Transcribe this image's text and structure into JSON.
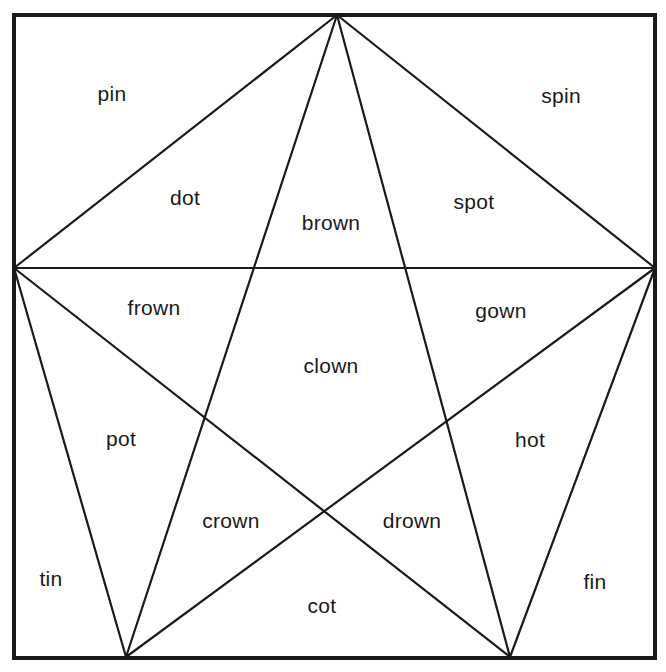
{
  "diagram": {
    "type": "pentagram-word-puzzle",
    "frame": {
      "x": 14,
      "y": 15,
      "width": 641,
      "height": 643
    },
    "vertices": {
      "top": [
        337,
        15
      ],
      "left": [
        14,
        268
      ],
      "right": [
        655,
        268
      ],
      "bottom_left": [
        126,
        657
      ],
      "bottom_right": [
        510,
        657
      ]
    },
    "lines": [
      {
        "name": "pentagon-top-left",
        "from": "top",
        "to": "left"
      },
      {
        "name": "pentagon-top-right",
        "from": "top",
        "to": "right"
      },
      {
        "name": "pentagon-left-bottom-left",
        "from": "left",
        "to": "bottom_left"
      },
      {
        "name": "pentagon-right-bottom-right",
        "from": "right",
        "to": "bottom_right"
      },
      {
        "name": "star-left-right",
        "from": "left",
        "to": "right"
      },
      {
        "name": "star-top-bottom-left",
        "from": "top",
        "to": "bottom_left"
      },
      {
        "name": "star-top-bottom-right",
        "from": "top",
        "to": "bottom_right"
      },
      {
        "name": "star-left-bottom-right",
        "from": "left",
        "to": "bottom_right"
      },
      {
        "name": "star-right-bottom-left",
        "from": "right",
        "to": "bottom_left"
      }
    ],
    "labels": {
      "pin": "pin",
      "spin": "spin",
      "dot": "dot",
      "brown": "brown",
      "spot": "spot",
      "frown": "frown",
      "gown": "gown",
      "clown": "clown",
      "pot": "pot",
      "hot": "hot",
      "crown": "crown",
      "drown": "drown",
      "tin": "tin",
      "cot": "cot",
      "fin": "fin"
    },
    "colors": {
      "line": "#1a1a1a",
      "text": "#1a1a1a",
      "background": "#ffffff"
    }
  }
}
